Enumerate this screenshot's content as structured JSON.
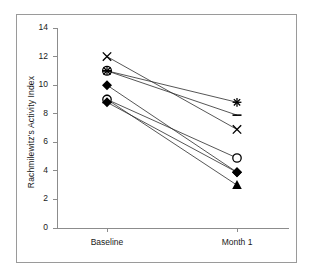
{
  "chart_data": {
    "type": "line",
    "title": "",
    "subtitle": "",
    "xlabel": "",
    "ylabel": "Rachmilewitz's Activity Index",
    "categories": [
      "Baseline",
      "Month 1"
    ],
    "x": [
      0,
      1
    ],
    "xlim": [
      -0.5,
      1.5
    ],
    "ylim": [
      0,
      14
    ],
    "yticks": [
      0,
      2,
      4,
      6,
      8,
      10,
      12,
      14
    ],
    "ytick_labels": [
      "0",
      "2",
      "4",
      "6",
      "8",
      "10",
      "12",
      "14"
    ],
    "grid": false,
    "legend": "none",
    "series": [
      {
        "name": "subject-1",
        "marker": "x-cross",
        "values": [
          12.0,
          6.9
        ]
      },
      {
        "name": "subject-2",
        "marker": "asterisk-in-circle",
        "values": [
          11.0,
          8.8
        ]
      },
      {
        "name": "subject-3",
        "marker": "dash",
        "values": [
          11.0,
          7.9
        ]
      },
      {
        "name": "subject-4",
        "marker": "filled-diamond",
        "values": [
          10.0,
          3.9
        ]
      },
      {
        "name": "subject-5",
        "marker": "filled-triangle",
        "values": [
          9.0,
          3.0
        ]
      },
      {
        "name": "subject-6",
        "marker": "open-circle",
        "values": [
          9.0,
          4.9
        ]
      },
      {
        "name": "subject-7",
        "marker": "filled-diamond",
        "values": [
          8.8,
          3.9
        ]
      }
    ],
    "colors": {
      "line": "#2b2b2b",
      "marker": "#000000",
      "axis": "#8c8c8c",
      "frame": "#9a9a9a",
      "background": "#ffffff",
      "text": "#1a1a1a"
    }
  },
  "axes": {
    "y_title": "Rachmilewitz's Activity Index",
    "y_ticks": [
      "14",
      "12",
      "10",
      "8",
      "6",
      "4",
      "2",
      "0"
    ],
    "x_ticks": [
      "Baseline",
      "Month 1"
    ]
  }
}
